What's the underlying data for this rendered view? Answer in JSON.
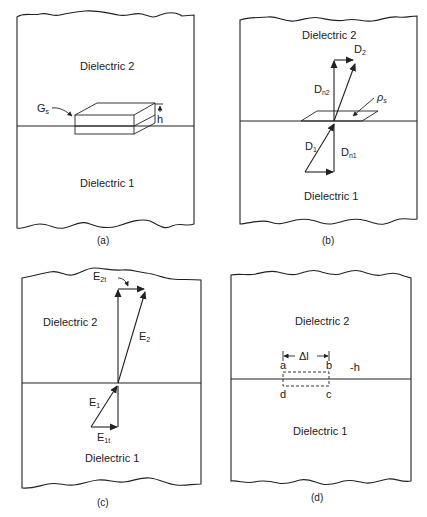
{
  "figure": {
    "panels": [
      {
        "id": "a",
        "caption": "(a)",
        "upper_region": "Dielectric 2",
        "lower_region": "Dielectric 1",
        "labels": {
          "surface": "G",
          "surface_sub": "s",
          "height": "h"
        }
      },
      {
        "id": "b",
        "caption": "(b)",
        "upper_region": "Dielectric 2",
        "lower_region": "Dielectric 1",
        "labels": {
          "d2": "D",
          "d2_sub": "2",
          "dn2": "D",
          "dn2_sub": "n2",
          "rho": "ρ",
          "rho_sub": "s",
          "d1": "D",
          "d1_sub": "1",
          "dn1": "D",
          "dn1_sub": "n1"
        }
      },
      {
        "id": "c",
        "caption": "(c)",
        "upper_region": "Dielectric 2",
        "lower_region": "Dielectric 1",
        "labels": {
          "e2t": "E",
          "e2t_sub": "2t",
          "e2": "E",
          "e2_sub": "2",
          "e1": "E",
          "e1_sub": "1",
          "e1t": "E",
          "e1t_sub": "1t"
        }
      },
      {
        "id": "d",
        "caption": "(d)",
        "upper_region": "Dielectric 2",
        "lower_region": "Dielectric 1",
        "labels": {
          "delta_l": "Δl",
          "a": "a",
          "b": "b",
          "c": "c",
          "d": "d",
          "h": "-h"
        }
      }
    ]
  }
}
